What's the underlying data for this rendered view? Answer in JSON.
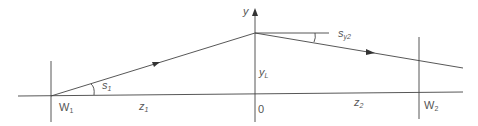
{
  "diagram": {
    "type": "ray-geometry",
    "labels": {
      "y_axis": "y",
      "origin": "0",
      "w1": "W",
      "w1_sub": "1",
      "w2": "W",
      "w2_sub": "2",
      "z1": "z",
      "z1_sub": "1",
      "z2": "z",
      "z2_sub": "2",
      "s1": "s",
      "s1_sub": "1",
      "sy2": "s",
      "sy2_sub": "y2",
      "yL": "y",
      "yL_sub": "L"
    },
    "colors": {
      "line": "#444444",
      "text": "#555555",
      "background": "#ffffff"
    }
  }
}
